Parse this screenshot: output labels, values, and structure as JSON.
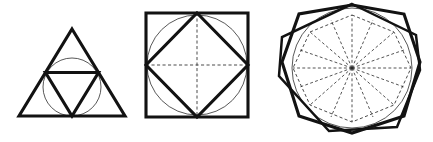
{
  "image": {
    "title": "Three nested polygon constructions",
    "description": "Three geometric line drawings: an equilateral triangle with inscribed circle and medial inverted triangle; a square with inscribed circle and inscribed rotated square with dashed diagonals; a regular octagon overlapping a hexagon with inscribed circle and dashed inner octagon with radial spokes.",
    "background_color": "#ffffff",
    "width": 433,
    "height": 142
  },
  "style": {
    "heavy_stroke_color": "#121212",
    "light_stroke_color": "#3a3a3a",
    "dashed_stroke_color": "#2a2a2a",
    "heavy_stroke_width": 3.1,
    "light_stroke_width": 0.85,
    "dash_pattern": "3.1 2.4"
  },
  "figures": [
    {
      "id": "figure-triangle",
      "name": "triangle-construction",
      "label": "Equilateral triangle with medial triangle and incircle",
      "sides": 3,
      "outer_polygon": {
        "name": "outer-triangle",
        "stroke": "heavy",
        "points": "72,29 125,116 19,116"
      },
      "inner_polygon": {
        "name": "medial-inverted-triangle",
        "stroke": "heavy",
        "points": "45.5,72.5 98.5,72.5 72,116"
      },
      "circle": {
        "name": "incircle",
        "stroke": "light",
        "cx": 72,
        "cy": 87,
        "r": 29
      }
    },
    {
      "id": "figure-square",
      "name": "square-construction",
      "label": "Square with inscribed circle, rotated square and dashed diagonals",
      "sides": 4,
      "outer_polygon": {
        "name": "outer-square",
        "stroke": "heavy",
        "points": "146,13 248,13 248,117 146,117"
      },
      "inner_polygon": {
        "name": "inscribed-rotated-square",
        "stroke": "heavy",
        "points": "197,13 248,65 197,117 146,65"
      },
      "circle": {
        "name": "inscribed-circle",
        "stroke": "light",
        "cx": 197,
        "cy": 65,
        "r": 50
      },
      "dashed_lines": [
        {
          "name": "dashed-vertical-axis",
          "x1": 197,
          "y1": 13,
          "x2": 197,
          "y2": 117
        },
        {
          "name": "dashed-horizontal-axis",
          "x1": 146,
          "y1": 65,
          "x2": 248,
          "y2": 65
        }
      ]
    },
    {
      "id": "figure-octagon",
      "name": "octagon-hexagon-construction",
      "label": "Octagon overlapping hexagon with inscribed circle, dashed inner octagon and radial spokes",
      "sides": 8,
      "outer_polygon": {
        "name": "outer-octagon",
        "stroke": "heavy",
        "points": "352,5 404,14 420,62 404,116 352,133 299,116 282,62 299,14"
      },
      "secondary_polygon": {
        "name": "overlapping-hexagon",
        "stroke": "heavy-thin",
        "points": "352,4 416,35 420,70 397,127 329,131 279,76 282,37"
      },
      "circle": {
        "name": "inscribed-circle",
        "stroke": "light",
        "cx": 352,
        "cy": 68,
        "r": 60
      },
      "inner_dashed_polygon": {
        "name": "dashed-inner-octagon",
        "points": "352,15 394,32 411,68 394,105 352,122 310,105 293,68 310,32"
      },
      "spokes": {
        "name": "radial-spokes",
        "center": {
          "cx": 352,
          "cy": 68
        },
        "count": 16,
        "targets": [
          "352,15",
          "373,20",
          "394,32",
          "404,50",
          "411,68",
          "404,87",
          "394,105",
          "373,117",
          "352,122",
          "331,117",
          "310,105",
          "300,87",
          "293,68",
          "300,50",
          "310,32",
          "331,20"
        ]
      }
    }
  ]
}
